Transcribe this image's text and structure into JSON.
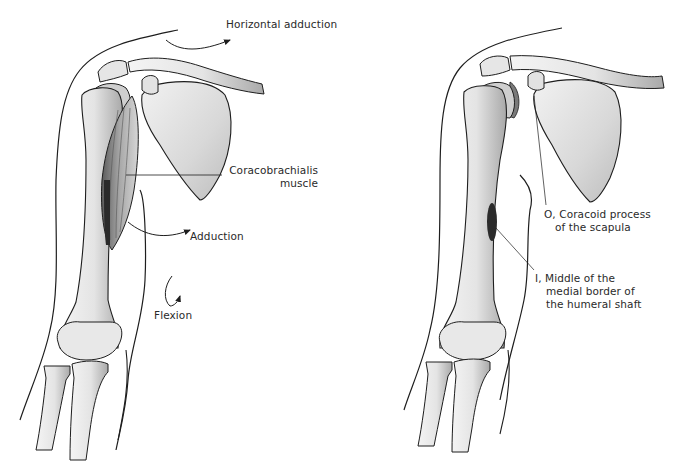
{
  "figure": {
    "subject": "Coracobrachialis muscle",
    "left_panel": {
      "title": "Actions",
      "labels": {
        "horizontal_adduction": "Horizontal adduction",
        "muscle_line1": "Coracobrachialis",
        "muscle_line2": "muscle",
        "adduction": "Adduction",
        "flexion": "Flexion"
      }
    },
    "right_panel": {
      "title": "Attachments",
      "labels": {
        "origin_line1": "O, Coracoid process",
        "origin_line2": "of the scapula",
        "insertion_line1": "I, Middle of the",
        "insertion_line2": "medial border of",
        "insertion_line3": "the humeral shaft"
      }
    },
    "colors": {
      "background": "#ffffff",
      "line": "#1e1e1e",
      "bone_fill": "#ededed",
      "bone_shade": "#b8b8b8",
      "muscle_fill": "#8a8a8a",
      "attachment_mark": "#2b2b2b",
      "text": "#2a2a2a"
    }
  }
}
